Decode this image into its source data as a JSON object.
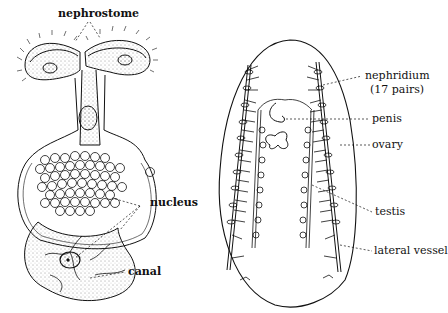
{
  "figure": {
    "left_diagram": {
      "subject": "single nephridium cell detail",
      "labels": {
        "nephrostome": "nephrostome",
        "nucleus": "nucleus",
        "canal": "canal"
      }
    },
    "right_diagram": {
      "subject": "whole body dorsal view showing paired organs",
      "labels": {
        "nephridium": "nephridium",
        "nephridium_count": "(17 pairs)",
        "penis": "penis",
        "ovary": "ovary",
        "testis": "testis",
        "lateral_vessel": "lateral vessel"
      }
    },
    "colors": {
      "ink": "#111111",
      "background": "#ffffff"
    }
  }
}
